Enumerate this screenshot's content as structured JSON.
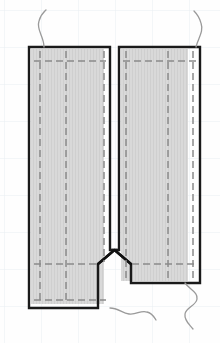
{
  "figure": {
    "name": "sewing-pattern-diagram",
    "title": "",
    "canvas": {
      "width": 220,
      "height": 343
    }
  },
  "colors": {
    "background": "#fefefe",
    "grid_line": "#e9eef2",
    "fabric_fill": "#d9d9d9",
    "fabric_texture": "#cfcfcf",
    "outline": "#1a1a1a",
    "stitch_dashed": "#8a8a8a",
    "thread": "#9a9a9a",
    "notch": "#111111"
  },
  "grid": {
    "visible": true,
    "spacing_px": 37,
    "x_lines": [
      4,
      41,
      78,
      115,
      152,
      189
    ],
    "y_lines": [
      10,
      47,
      84,
      121,
      158,
      195,
      232,
      269,
      306
    ]
  },
  "panels": [
    {
      "name": "left-panel",
      "label": "Left front panel",
      "x": 29,
      "y": 47,
      "width": 81,
      "height": 261,
      "fill": "#d9d9d9"
    },
    {
      "name": "right-panel",
      "label": "Right front panel",
      "x": 119,
      "y": 47,
      "width": 81,
      "height": 236,
      "fill": "#d9d9d9"
    }
  ],
  "slit": {
    "name": "center-slit",
    "label": "Center front slit",
    "x": 110,
    "width": 9,
    "top_y": 47,
    "bottom_y": 250
  },
  "notch": {
    "name": "v-notch",
    "label": "V clip at slit base",
    "apex_x": 114.5,
    "apex_y": 250,
    "left_x": 98,
    "right_x": 131,
    "base_y": 264
  },
  "stitch_lines": {
    "horizontal": [
      {
        "name": "top-hem-stitch-left",
        "x1": 34,
        "x2": 106,
        "y": 61
      },
      {
        "name": "top-hem-stitch-right",
        "x1": 123,
        "x2": 196,
        "y": 61
      },
      {
        "name": "waist-stitch-left",
        "x1": 34,
        "x2": 106,
        "y": 264
      },
      {
        "name": "waist-stitch-right",
        "x1": 123,
        "x2": 196,
        "y": 264
      },
      {
        "name": "bottom-hem-stitch",
        "x1": 34,
        "x2": 106,
        "y": 300
      }
    ],
    "vertical": [
      {
        "name": "left-edge-stitch",
        "x": 40,
        "y1": 52,
        "y2": 303
      },
      {
        "name": "left-pleat-stitch",
        "x": 66,
        "y1": 52,
        "y2": 303
      },
      {
        "name": "left-slit-edge-stitch",
        "x": 104,
        "y1": 52,
        "y2": 264
      },
      {
        "name": "right-slit-edge-stitch",
        "x": 126,
        "y1": 52,
        "y2": 278
      },
      {
        "name": "right-pleat-stitch",
        "x": 168,
        "y1": 52,
        "y2": 278
      },
      {
        "name": "right-edge-stitch",
        "x": 193,
        "y1": 52,
        "y2": 278
      }
    ]
  },
  "threads": [
    {
      "name": "thread-tail-top-left",
      "position": "top-left"
    },
    {
      "name": "thread-tail-top-right",
      "position": "top-right"
    },
    {
      "name": "thread-tail-bottom-left",
      "position": "bottom-center-left"
    },
    {
      "name": "thread-tail-bottom-right",
      "position": "bottom-right"
    }
  ]
}
